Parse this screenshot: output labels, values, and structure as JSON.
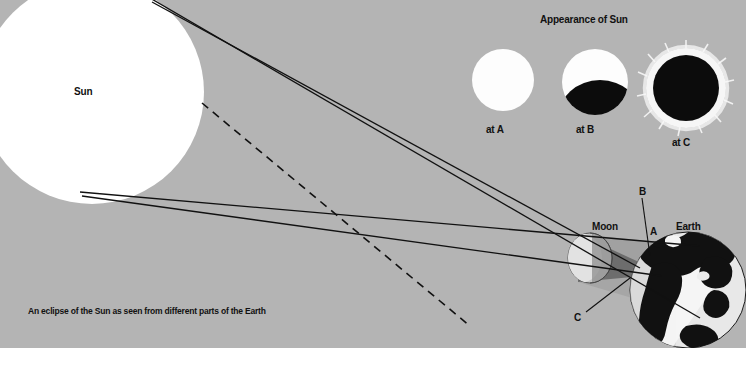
{
  "figure": {
    "caption": "An eclipse of the Sun as seen from different parts of the Earth",
    "background_color": "#b4b4b4",
    "ink_color": "#111111",
    "sun_color": "#ffffff",
    "bottom_margin_color": "#ffffff"
  },
  "bodies": {
    "sun_label": "Sun",
    "moon_label": "Moon",
    "earth_label": "Earth"
  },
  "observer_points": {
    "a": "A",
    "b": "B",
    "c": "C"
  },
  "appearance_panel": {
    "title": "Appearance of Sun",
    "views": [
      {
        "label": "at A",
        "state": "uneclipsed",
        "covered_fraction": 0.0,
        "corona": false
      },
      {
        "label": "at B",
        "state": "partial",
        "covered_fraction": 0.45,
        "corona": false
      },
      {
        "label": "at C",
        "state": "total",
        "covered_fraction": 1.0,
        "corona": true
      }
    ]
  },
  "shadow": {
    "umbra_label": "umbra",
    "penumbra_label": "penumbra",
    "umbra_color": "#6e6e6e",
    "penumbra_color": "#9a9a9a"
  },
  "rays": {
    "solid_label": "light ray",
    "dashed_label": "sight line",
    "solid_count": 4,
    "dashed_count": 1
  }
}
